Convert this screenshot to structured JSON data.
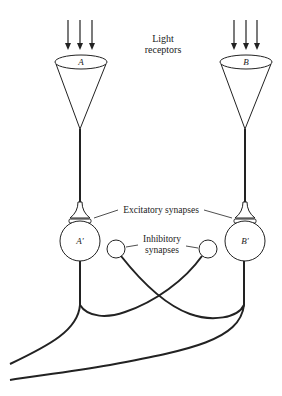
{
  "diagram": {
    "title_label": {
      "line1": "Light",
      "line2": "receptors"
    },
    "receptors": [
      {
        "id": "A",
        "label": "A"
      },
      {
        "id": "B",
        "label": "B"
      }
    ],
    "neurons": [
      {
        "id": "A'",
        "label": "A′"
      },
      {
        "id": "B'",
        "label": "B′"
      }
    ],
    "excitatory_label": "Excitatory synapses",
    "inhibitory_label": {
      "line1": "Inhibitory",
      "line2": "synapses"
    },
    "colors": {
      "stroke": "#222222",
      "background": "#ffffff"
    }
  }
}
